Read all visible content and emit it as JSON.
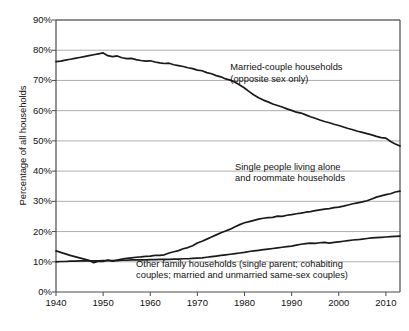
{
  "chart_data": {
    "type": "line",
    "title": "",
    "xlabel": "",
    "ylabel": "Percentage of all households",
    "xlim": [
      1940,
      2013
    ],
    "ylim": [
      0,
      90
    ],
    "grid": true,
    "legend_position": "inline-annotations",
    "ytick_labels": [
      "0%",
      "10%",
      "20%",
      "30%",
      "40%",
      "50%",
      "60%",
      "70%",
      "80%",
      "90%"
    ],
    "ytick_values": [
      0,
      10,
      20,
      30,
      40,
      50,
      60,
      70,
      80,
      90
    ],
    "xtick_labels": [
      "1940",
      "1950",
      "1960",
      "1970",
      "1980",
      "1990",
      "2000",
      "2010"
    ],
    "xtick_values": [
      1940,
      1950,
      1960,
      1970,
      1980,
      1990,
      2000,
      2010
    ],
    "annotations": [
      {
        "name": "married-couple-annotation",
        "line1": "Married-couple households",
        "line2": "(opposite sex only)",
        "x": 1977,
        "y": 74
      },
      {
        "name": "single-people-annotation",
        "line1": "Single people living alone",
        "line2": "and roommate households",
        "x": 1978,
        "y": 41
      },
      {
        "name": "other-family-annotation",
        "line1": "Other family households (single parent; cohabiting",
        "line2": "couples; married and unmarried same-sex couples)",
        "x": 1957,
        "y": 9
      }
    ],
    "series": [
      {
        "name": "Married-couple households (opposite sex only)",
        "x": [
          1940,
          1941,
          1942,
          1943,
          1944,
          1945,
          1946,
          1947,
          1948,
          1949,
          1950,
          1951,
          1952,
          1953,
          1954,
          1955,
          1956,
          1957,
          1958,
          1959,
          1960,
          1961,
          1962,
          1963,
          1964,
          1965,
          1966,
          1967,
          1968,
          1969,
          1970,
          1971,
          1972,
          1973,
          1974,
          1975,
          1976,
          1977,
          1978,
          1979,
          1980,
          1981,
          1982,
          1983,
          1984,
          1985,
          1986,
          1987,
          1988,
          1989,
          1990,
          1991,
          1992,
          1993,
          1994,
          1995,
          1996,
          1997,
          1998,
          1999,
          2000,
          2001,
          2002,
          2003,
          2004,
          2005,
          2006,
          2007,
          2008,
          2009,
          2010,
          2011,
          2012,
          2013
        ],
        "values": [
          76.2,
          76.4,
          76.7,
          77.0,
          77.3,
          77.6,
          77.9,
          78.2,
          78.5,
          78.8,
          79.1,
          78.2,
          77.9,
          78.1,
          77.5,
          77.2,
          77.3,
          76.9,
          76.6,
          76.4,
          76.5,
          76.1,
          75.8,
          75.6,
          75.7,
          75.2,
          74.9,
          74.6,
          74.2,
          73.9,
          73.4,
          73.2,
          72.6,
          72.2,
          71.6,
          71.2,
          70.5,
          70.1,
          69.4,
          68.5,
          67.5,
          66.3,
          65.2,
          64.3,
          63.5,
          62.9,
          62.2,
          61.7,
          61.2,
          60.6,
          60.1,
          59.5,
          59.2,
          58.6,
          58.0,
          57.5,
          56.9,
          56.4,
          56.0,
          55.5,
          55.1,
          54.6,
          54.1,
          53.7,
          53.2,
          52.8,
          52.4,
          52.0,
          51.5,
          51.1,
          50.9,
          49.8,
          49.0,
          48.3
        ],
        "color": "#1a1a1a"
      },
      {
        "name": "Single people living alone and roommate households",
        "x": [
          1940,
          1941,
          1942,
          1943,
          1944,
          1945,
          1946,
          1947,
          1948,
          1949,
          1950,
          1951,
          1952,
          1953,
          1954,
          1955,
          1956,
          1957,
          1958,
          1959,
          1960,
          1961,
          1962,
          1963,
          1964,
          1965,
          1966,
          1967,
          1968,
          1969,
          1970,
          1971,
          1972,
          1973,
          1974,
          1975,
          1976,
          1977,
          1978,
          1979,
          1980,
          1981,
          1982,
          1983,
          1984,
          1985,
          1986,
          1987,
          1988,
          1989,
          1990,
          1991,
          1992,
          1993,
          1994,
          1995,
          1996,
          1997,
          1998,
          1999,
          2000,
          2001,
          2002,
          2003,
          2004,
          2005,
          2006,
          2007,
          2008,
          2009,
          2010,
          2011,
          2012,
          2013
        ],
        "values": [
          13.6,
          13.1,
          12.6,
          12.1,
          11.7,
          11.3,
          10.9,
          10.5,
          9.7,
          10.2,
          10.1,
          10.6,
          10.2,
          10.6,
          10.9,
          11.1,
          11.3,
          11.5,
          11.6,
          11.8,
          11.9,
          12.1,
          12.1,
          12.3,
          12.9,
          13.3,
          13.7,
          14.3,
          14.7,
          15.3,
          16.2,
          16.8,
          17.5,
          18.2,
          18.9,
          19.6,
          20.2,
          20.8,
          21.6,
          22.3,
          22.9,
          23.3,
          23.7,
          24.1,
          24.4,
          24.6,
          24.7,
          25.1,
          25.0,
          25.4,
          25.6,
          25.9,
          26.1,
          26.4,
          26.6,
          26.9,
          27.2,
          27.4,
          27.6,
          27.9,
          28.1,
          28.4,
          28.8,
          29.2,
          29.5,
          29.8,
          30.2,
          30.8,
          31.4,
          31.8,
          32.2,
          32.5,
          33.1,
          33.4
        ],
        "color": "#1a1a1a"
      },
      {
        "name": "Other family households (single parent; cohabiting couples; married and unmarried same-sex couples)",
        "x": [
          1940,
          1941,
          1942,
          1943,
          1944,
          1945,
          1946,
          1947,
          1948,
          1949,
          1950,
          1951,
          1952,
          1953,
          1954,
          1955,
          1956,
          1957,
          1958,
          1959,
          1960,
          1961,
          1962,
          1963,
          1964,
          1965,
          1966,
          1967,
          1968,
          1969,
          1970,
          1971,
          1972,
          1973,
          1974,
          1975,
          1976,
          1977,
          1978,
          1979,
          1980,
          1981,
          1982,
          1983,
          1984,
          1985,
          1986,
          1987,
          1988,
          1989,
          1990,
          1991,
          1992,
          1993,
          1994,
          1995,
          1996,
          1997,
          1998,
          1999,
          2000,
          2001,
          2002,
          2003,
          2004,
          2005,
          2006,
          2007,
          2008,
          2009,
          2010,
          2011,
          2012,
          2013
        ],
        "values": [
          10.0,
          10.1,
          10.1,
          10.2,
          10.2,
          10.3,
          10.3,
          10.3,
          10.3,
          10.3,
          10.4,
          10.4,
          10.4,
          10.4,
          10.5,
          10.5,
          10.6,
          10.6,
          10.6,
          10.6,
          10.7,
          10.7,
          10.8,
          10.8,
          10.8,
          10.9,
          10.9,
          11.0,
          11.0,
          11.1,
          11.2,
          11.3,
          11.5,
          11.7,
          11.9,
          12.1,
          12.3,
          12.5,
          12.7,
          12.9,
          13.1,
          13.4,
          13.6,
          13.8,
          14.0,
          14.2,
          14.4,
          14.6,
          14.8,
          15.0,
          15.2,
          15.5,
          15.8,
          16.0,
          16.2,
          16.1,
          16.3,
          16.4,
          16.2,
          16.4,
          16.6,
          16.8,
          17.0,
          17.2,
          17.3,
          17.5,
          17.7,
          17.9,
          18.0,
          18.1,
          18.2,
          18.3,
          18.4,
          18.5
        ],
        "color": "#1a1a1a"
      }
    ]
  }
}
